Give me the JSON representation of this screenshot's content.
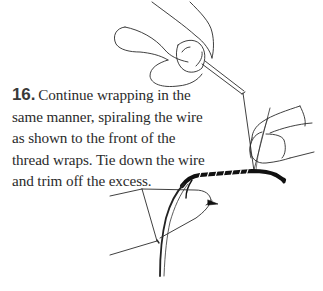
{
  "step": {
    "number": "16.",
    "lines": [
      "Continue wrapping in the",
      "same manner, spiraling the wire",
      "as shown to the front of the",
      "thread wraps. Tie down the wire",
      "and trim off the excess."
    ]
  },
  "illustration": {
    "subject": "fly-tying-wire-wrap",
    "elements": [
      "fingers-holding-bobbin",
      "thread",
      "wire",
      "fingers-holding-wire",
      "hook-shank-with-wraps",
      "vise-jaws"
    ],
    "ink_color": "#1a1a1a",
    "background": "#ffffff"
  }
}
